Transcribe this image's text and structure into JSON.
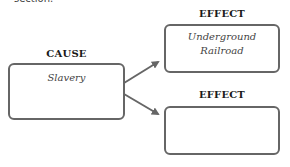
{
  "header": {
    "cut_text": "section."
  },
  "diagram": {
    "cause": {
      "label": "CAUSE",
      "text": "Slavery"
    },
    "effects": [
      {
        "label": "EFFECT",
        "line1": "Underground",
        "line2": "Railroad"
      },
      {
        "label": "EFFECT",
        "line1": "",
        "line2": ""
      }
    ]
  },
  "colors": {
    "border": "#666666",
    "arrow": "#666666",
    "label": "#1a1a1a"
  }
}
